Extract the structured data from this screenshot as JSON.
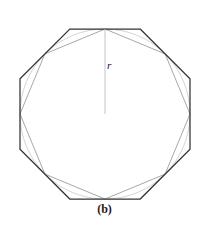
{
  "figure": {
    "caption": "(b)",
    "radius_label": "r",
    "colors": {
      "circumscribed_stroke": "#333333",
      "inscribed_stroke": "#a8a8a8",
      "circle_stroke": "#c9c9c9",
      "radius_stroke": "#bdbdbd",
      "background": "#ffffff",
      "text": "#1a1a1a"
    }
  },
  "chart_data": {
    "type": "diagram",
    "title": "(b)",
    "center": {
      "x": 105,
      "y": 114
    },
    "circle": {
      "cx": 105,
      "cy": 114,
      "r": 85
    },
    "radius_segment": {
      "x1": 105,
      "y1": 114,
      "x2": 105,
      "y2": 29,
      "label": "r"
    },
    "shapes": [
      {
        "name": "inscribed-octagon",
        "sides": 8,
        "role": "inscribed",
        "circumradius": 85,
        "rotation_deg": -90,
        "stroke": "#a8a8a8",
        "vertices": [
          [
            105,
            29
          ],
          [
            165.1,
            53.9
          ],
          [
            190,
            114
          ],
          [
            165.1,
            174.1
          ],
          [
            105,
            199
          ],
          [
            44.9,
            174.1
          ],
          [
            20,
            114
          ],
          [
            44.9,
            53.9
          ]
        ]
      },
      {
        "name": "circumscribed-octagon",
        "sides": 8,
        "role": "circumscribed",
        "inradius": 85,
        "circumradius": 92.02,
        "rotation_deg": -67.5,
        "stroke": "#333333",
        "vertices": [
          [
            140.2,
            29
          ],
          [
            190,
            78.8
          ],
          [
            190,
            149.2
          ],
          [
            140.2,
            199
          ],
          [
            69.8,
            199
          ],
          [
            20,
            149.2
          ],
          [
            20,
            78.8
          ],
          [
            69.8,
            29
          ]
        ]
      }
    ],
    "axis": {
      "visible": false
    },
    "grid": false,
    "legend": {
      "visible": false
    }
  }
}
